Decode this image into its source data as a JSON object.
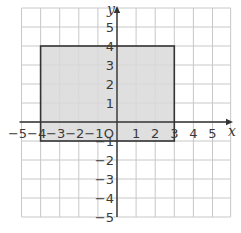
{
  "diagram": {
    "type": "coordinate-grid",
    "x_axis": {
      "label": "x",
      "min": -5,
      "max": 5,
      "ticks": [
        "−5",
        "−4",
        "−3",
        "−2",
        "−1",
        "1",
        "2",
        "3",
        "4",
        "5"
      ]
    },
    "y_axis": {
      "label": "y",
      "min": -5,
      "max": 5,
      "ticks": [
        "5",
        "4",
        "3",
        "2",
        "1",
        "−1",
        "−2",
        "−3",
        "−4",
        "−5"
      ]
    },
    "origin_label": "O",
    "shape": {
      "type": "rectangle",
      "vertices": [
        [
          -4,
          4
        ],
        [
          3,
          4
        ],
        [
          3,
          -1
        ],
        [
          -4,
          -1
        ]
      ],
      "fill": "#d9d9d9",
      "stroke": "#333333"
    },
    "colors": {
      "grid": "#c8c8c8",
      "axis": "#333333",
      "background": "#ffffff"
    }
  }
}
